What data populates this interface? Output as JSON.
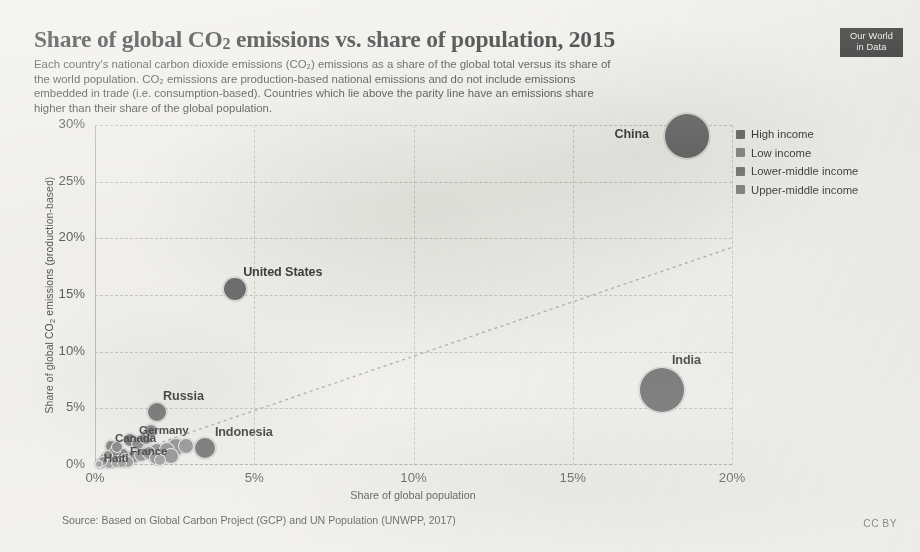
{
  "header": {
    "title_part1": "Share of global CO",
    "title_sub": "2",
    "title_part2": " emissions vs. share of population, 2015",
    "subtitle_line1": "Each country's national carbon dioxide emissions (CO₂) emissions as a share of the global total versus its share of",
    "subtitle_line2": "the world population. CO₂ emissions are production-based national emissions and do not include emissions",
    "subtitle_line3": "embedded in trade (i.e. consumption-based). Countries which lie above the parity line have an emissions share",
    "subtitle_line4": "higher than their share of the global population."
  },
  "logo": {
    "line1": "Our World",
    "line2": "in Data"
  },
  "footer": {
    "source": "Source: Based on Global Carbon Project (GCP) and UN Population (UNWPP, 2017)",
    "license": "CC BY"
  },
  "legend": {
    "items": [
      {
        "label": "High income",
        "color": "#6f6f6f"
      },
      {
        "label": "Low income",
        "color": "#8a8a8a"
      },
      {
        "label": "Lower-middle income",
        "color": "#7a7a7a"
      },
      {
        "label": "Upper-middle income",
        "color": "#858585"
      }
    ]
  },
  "chart_data": {
    "type": "scatter",
    "title": "Share of global CO2 emissions vs. share of population, 2015",
    "xlabel": "Share of global population",
    "ylabel": "Share of global CO₂ emissions (production-based)",
    "xlim": [
      0,
      20
    ],
    "ylim": [
      0,
      30
    ],
    "xticks": [
      "0%",
      "5%",
      "10%",
      "15%",
      "20%"
    ],
    "xtick_values": [
      0,
      5,
      10,
      15,
      20
    ],
    "yticks": [
      "0%",
      "5%",
      "10%",
      "15%",
      "20%",
      "25%",
      "30%"
    ],
    "ytick_values": [
      0,
      5,
      10,
      15,
      20,
      25,
      30
    ],
    "grid": true,
    "legend_position": "right",
    "annotation_line": {
      "name": "parity-line",
      "style": "dotted",
      "from": [
        0,
        0
      ],
      "to": [
        20,
        19.2
      ]
    },
    "points": [
      {
        "name": "China",
        "x": 18.6,
        "y": 29.0,
        "r": 23,
        "group": "Upper-middle income",
        "color": "#6b6b6b",
        "label": true,
        "label_dx": -73,
        "label_dy": -2
      },
      {
        "name": "India",
        "x": 17.8,
        "y": 6.6,
        "r": 23,
        "group": "Lower-middle income",
        "color": "#6e6e6e",
        "label": true,
        "label_dx": 10,
        "label_dy": -30
      },
      {
        "name": "United States",
        "x": 4.4,
        "y": 15.5,
        "r": 12,
        "group": "High income",
        "color": "#6a6a6a",
        "label": true,
        "label_dx": 8,
        "label_dy": -17
      },
      {
        "name": "Russia",
        "x": 1.95,
        "y": 4.7,
        "r": 10,
        "group": "Upper-middle income",
        "color": "#737373",
        "label": true,
        "label_dx": 6,
        "label_dy": -16
      },
      {
        "name": "Indonesia",
        "x": 3.45,
        "y": 1.5,
        "r": 11,
        "group": "Lower-middle income",
        "color": "#717171",
        "label": true,
        "label_dx": 10,
        "label_dy": -16
      },
      {
        "name": "Germany",
        "x": 1.1,
        "y": 2.25,
        "r": 7,
        "group": "High income",
        "color": "#767676",
        "label": true,
        "label_dx": 9,
        "label_dy": -11
      },
      {
        "name": "Canada",
        "x": 0.5,
        "y": 1.7,
        "r": 6,
        "group": "High income",
        "color": "#7a7a7a",
        "label": true,
        "label_dx": 4,
        "label_dy": -9
      },
      {
        "name": "France",
        "x": 0.88,
        "y": 1.0,
        "r": 6,
        "group": "High income",
        "color": "#7d7d7d",
        "label": true,
        "label_dx": 7,
        "label_dy": -4
      },
      {
        "name": "Haiti",
        "x": 0.15,
        "y": 0.1,
        "r": 5,
        "group": "Low income",
        "color": "#8a8a8a",
        "label": true,
        "label_dx": 4,
        "label_dy": -7
      },
      {
        "name": "p01",
        "x": 0.2,
        "y": 0.15,
        "r": 5,
        "group": "Low income",
        "color": "#9b9b9b",
        "label": false
      },
      {
        "name": "p02",
        "x": 0.35,
        "y": 0.22,
        "r": 5,
        "group": "Low income",
        "color": "#999999",
        "label": false
      },
      {
        "name": "p03",
        "x": 0.55,
        "y": 0.3,
        "r": 6,
        "group": "Lower-middle income",
        "color": "#949494",
        "label": false
      },
      {
        "name": "p04",
        "x": 0.75,
        "y": 0.42,
        "r": 6,
        "group": "Lower-middle income",
        "color": "#909090",
        "label": false
      },
      {
        "name": "p05",
        "x": 0.95,
        "y": 0.55,
        "r": 6,
        "group": "Upper-middle income",
        "color": "#8d8d8d",
        "label": false
      },
      {
        "name": "p06",
        "x": 1.2,
        "y": 0.7,
        "r": 7,
        "group": "Upper-middle income",
        "color": "#8a8a8a",
        "label": false
      },
      {
        "name": "p07",
        "x": 1.45,
        "y": 0.85,
        "r": 7,
        "group": "Lower-middle income",
        "color": "#8e8e8e",
        "label": false
      },
      {
        "name": "p08",
        "x": 1.7,
        "y": 1.05,
        "r": 7,
        "group": "Upper-middle income",
        "color": "#898989",
        "label": false
      },
      {
        "name": "p09",
        "x": 1.95,
        "y": 1.2,
        "r": 8,
        "group": "Upper-middle income",
        "color": "#8b8b8b",
        "label": false
      },
      {
        "name": "p10",
        "x": 2.25,
        "y": 1.35,
        "r": 8,
        "group": "Lower-middle income",
        "color": "#909090",
        "label": false
      },
      {
        "name": "p11",
        "x": 2.55,
        "y": 1.55,
        "r": 9,
        "group": "Lower-middle income",
        "color": "#8d8d8d",
        "label": false
      },
      {
        "name": "p12",
        "x": 2.85,
        "y": 1.7,
        "r": 8,
        "group": "Lower-middle income",
        "color": "#929292",
        "label": false
      },
      {
        "name": "p13",
        "x": 0.3,
        "y": 0.6,
        "r": 5,
        "group": "High income",
        "color": "#8a8a8a",
        "label": false
      },
      {
        "name": "p14",
        "x": 0.42,
        "y": 0.9,
        "r": 5,
        "group": "High income",
        "color": "#878787",
        "label": false
      },
      {
        "name": "p15",
        "x": 0.62,
        "y": 1.25,
        "r": 6,
        "group": "High income",
        "color": "#848484",
        "label": false
      },
      {
        "name": "p16",
        "x": 0.7,
        "y": 1.55,
        "r": 6,
        "group": "High income",
        "color": "#818181",
        "label": false
      },
      {
        "name": "p17",
        "x": 1.35,
        "y": 1.95,
        "r": 7,
        "group": "Upper-middle income",
        "color": "#858585",
        "label": false
      },
      {
        "name": "p18",
        "x": 1.6,
        "y": 2.4,
        "r": 7,
        "group": "Upper-middle income",
        "color": "#828282",
        "label": false
      },
      {
        "name": "p19",
        "x": 1.75,
        "y": 3.0,
        "r": 7,
        "group": "Upper-middle income",
        "color": "#808080",
        "label": false
      },
      {
        "name": "p20",
        "x": 0.12,
        "y": 0.05,
        "r": 4,
        "group": "Low income",
        "color": "#9d9d9d",
        "label": false
      },
      {
        "name": "p21",
        "x": 0.45,
        "y": 0.1,
        "r": 5,
        "group": "Low income",
        "color": "#9a9a9a",
        "label": false
      },
      {
        "name": "p22",
        "x": 0.65,
        "y": 0.18,
        "r": 5,
        "group": "Low income",
        "color": "#979797",
        "label": false
      },
      {
        "name": "p23",
        "x": 1.05,
        "y": 0.3,
        "r": 6,
        "group": "Lower-middle income",
        "color": "#949494",
        "label": false
      },
      {
        "name": "p24",
        "x": 1.9,
        "y": 0.6,
        "r": 7,
        "group": "Lower-middle income",
        "color": "#919191",
        "label": false
      },
      {
        "name": "p25",
        "x": 2.4,
        "y": 0.8,
        "r": 8,
        "group": "Lower-middle income",
        "color": "#8f8f8f",
        "label": false
      },
      {
        "name": "p26",
        "x": 0.25,
        "y": 0.35,
        "r": 5,
        "group": "High income",
        "color": "#8c8c8c",
        "label": false
      },
      {
        "name": "p27",
        "x": 0.85,
        "y": 0.2,
        "r": 5,
        "group": "Lower-middle income",
        "color": "#969696",
        "label": false
      },
      {
        "name": "p28",
        "x": 2.05,
        "y": 0.4,
        "r": 6,
        "group": "Low income",
        "color": "#9a9a9a",
        "label": false
      }
    ]
  }
}
